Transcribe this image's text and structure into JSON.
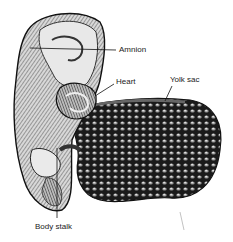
{
  "figure": {
    "labels": {
      "amnion": "Amnion",
      "heart": "Heart",
      "yolk_sac": "Yolk sac",
      "body_stalk": "Body stalk"
    }
  }
}
